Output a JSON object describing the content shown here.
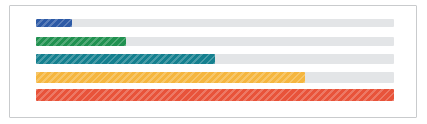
{
  "card": {
    "background_color": "#ffffff",
    "border_color": "#c9cbcd"
  },
  "track": {
    "color": "#e3e5e7"
  },
  "chart_data": {
    "type": "bar",
    "orientation": "horizontal",
    "title": "",
    "subtitle": "",
    "xlabel": "",
    "ylabel": "",
    "grid": false,
    "legend": false,
    "xlim": [
      0,
      100
    ],
    "unit": "percent",
    "style": "striped-progress-bars",
    "categories": [
      "bar-1",
      "bar-2",
      "bar-3",
      "bar-4",
      "bar-5"
    ],
    "values": [
      10,
      25,
      50,
      75,
      100
    ],
    "colors": [
      "#2d5aa6",
      "#219150",
      "#15808f",
      "#f5b63f",
      "#e8533a"
    ],
    "series": [
      {
        "name": "progress",
        "values": [
          10,
          25,
          50,
          75,
          100
        ]
      }
    ],
    "bars": [
      {
        "index": 1,
        "name": "blue-bar",
        "value": 10,
        "color": "#2d5aa6",
        "color_name": "blue",
        "track_color": "#e3e5e7",
        "striped": true,
        "height_px": 8
      },
      {
        "index": 2,
        "name": "green-bar",
        "value": 25,
        "color": "#219150",
        "color_name": "green",
        "track_color": "#e3e5e7",
        "striped": true,
        "height_px": 9
      },
      {
        "index": 3,
        "name": "teal-bar",
        "value": 50,
        "color": "#15808f",
        "color_name": "teal",
        "track_color": "#e3e5e7",
        "striped": true,
        "height_px": 10
      },
      {
        "index": 4,
        "name": "amber-bar",
        "value": 75,
        "color": "#f5b63f",
        "color_name": "amber",
        "track_color": "#e3e5e7",
        "striped": true,
        "height_px": 11
      },
      {
        "index": 5,
        "name": "red-bar",
        "value": 100,
        "color": "#e8533a",
        "color_name": "red",
        "track_color": "#e3e5e7",
        "striped": true,
        "height_px": 12
      }
    ]
  }
}
